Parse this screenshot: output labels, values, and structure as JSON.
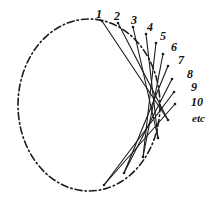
{
  "figure": {
    "title": "",
    "background_color": "#ffffff",
    "ink_color": "#1a1a1a",
    "width": 221,
    "height": 204
  },
  "circle": {
    "name": "dash-dot-circle",
    "center_x": 89,
    "center_y": 105,
    "radius_x": 71,
    "radius_y": 86,
    "stroke_color": "#1a1a1a",
    "stroke_width": 1.6,
    "dash_pattern": "7 3 1.5 3"
  },
  "labels": [
    {
      "text": "1",
      "x": 96,
      "y": 8,
      "size": 12
    },
    {
      "text": "2",
      "x": 114,
      "y": 10,
      "size": 12
    },
    {
      "text": "3",
      "x": 131,
      "y": 14,
      "size": 12
    },
    {
      "text": "4",
      "x": 147,
      "y": 21,
      "size": 12
    },
    {
      "text": "5",
      "x": 160,
      "y": 30,
      "size": 12
    },
    {
      "text": "6",
      "x": 171,
      "y": 41,
      "size": 12
    },
    {
      "text": "7",
      "x": 178,
      "y": 54,
      "size": 12
    },
    {
      "text": "8",
      "x": 187,
      "y": 68,
      "size": 12
    },
    {
      "text": "9",
      "x": 191,
      "y": 81,
      "size": 12
    },
    {
      "text": "10",
      "x": 191,
      "y": 96,
      "size": 12
    },
    {
      "text": "etc",
      "x": 192,
      "y": 113,
      "size": 11
    }
  ],
  "chart_data": {
    "type": "scatter",
    "xlabel": "",
    "ylabel": "",
    "grid": false,
    "legend": null,
    "xlim": [
      0,
      221
    ],
    "ylim": [
      0,
      204
    ],
    "series": [
      {
        "name": "marked points on circumference",
        "note": "Points numbered 1 through 10 progressing clockwise along the upper-right arc of the circle, continuing as 'etc'.",
        "labels": [
          "1",
          "2",
          "3",
          "4",
          "5",
          "6",
          "7",
          "8",
          "9",
          "10"
        ],
        "x": [
          102,
          118,
          133,
          146,
          156,
          163,
          168,
          172,
          174,
          175
        ],
        "y": [
          21,
          23,
          27,
          34,
          43,
          54,
          66,
          79,
          92,
          104
        ]
      },
      {
        "name": "chord endpoints on lower arc",
        "note": "Lower-arc endpoints that the successive chords run to.",
        "x": [
          168,
          158,
          143,
          124,
          104
        ],
        "y": [
          120,
          138,
          157,
          173,
          185
        ]
      }
    ],
    "chords": [
      {
        "from": "1",
        "to": "lower-arc-a",
        "x1": 102,
        "y1": 21,
        "x2": 168,
        "y2": 120
      },
      {
        "from": "2",
        "to": "lower-arc-a",
        "x1": 118,
        "y1": 23,
        "x2": 168,
        "y2": 120
      },
      {
        "from": "3",
        "to": "lower-arc-b",
        "x1": 133,
        "y1": 27,
        "x2": 158,
        "y2": 138
      },
      {
        "from": "4",
        "to": "lower-arc-b",
        "x1": 146,
        "y1": 34,
        "x2": 158,
        "y2": 138
      },
      {
        "from": "5",
        "to": "lower-arc-c",
        "x1": 156,
        "y1": 43,
        "x2": 143,
        "y2": 157
      },
      {
        "from": "6",
        "to": "lower-arc-c",
        "x1": 163,
        "y1": 54,
        "x2": 143,
        "y2": 157
      },
      {
        "from": "7",
        "to": "lower-arc-d",
        "x1": 168,
        "y1": 66,
        "x2": 124,
        "y2": 173
      },
      {
        "from": "8",
        "to": "lower-arc-d",
        "x1": 172,
        "y1": 79,
        "x2": 124,
        "y2": 173
      },
      {
        "from": "9",
        "to": "lower-arc-e",
        "x1": 174,
        "y1": 92,
        "x2": 104,
        "y2": 185
      },
      {
        "from": "10",
        "to": "lower-arc-e",
        "x1": 175,
        "y1": 104,
        "x2": 104,
        "y2": 185
      }
    ]
  }
}
